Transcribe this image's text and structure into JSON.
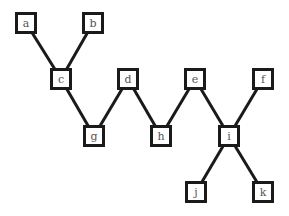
{
  "diagram": {
    "type": "graph",
    "stroke_color": "#1a1a1a",
    "label_color": "#555555",
    "nodes": [
      {
        "id": "a",
        "label": "a",
        "x": 15,
        "y": 12
      },
      {
        "id": "b",
        "label": "b",
        "x": 82,
        "y": 12
      },
      {
        "id": "c",
        "label": "c",
        "x": 50,
        "y": 68
      },
      {
        "id": "d",
        "label": "d",
        "x": 117,
        "y": 68
      },
      {
        "id": "e",
        "label": "e",
        "x": 184,
        "y": 68
      },
      {
        "id": "f",
        "label": "f",
        "x": 252,
        "y": 68
      },
      {
        "id": "g",
        "label": "g",
        "x": 83,
        "y": 125
      },
      {
        "id": "h",
        "label": "h",
        "x": 150,
        "y": 125
      },
      {
        "id": "i",
        "label": "i",
        "x": 218,
        "y": 125
      },
      {
        "id": "j",
        "label": "j",
        "x": 185,
        "y": 181
      },
      {
        "id": "k",
        "label": "k",
        "x": 252,
        "y": 181
      }
    ],
    "edges": [
      [
        "a",
        "c"
      ],
      [
        "b",
        "c"
      ],
      [
        "c",
        "g"
      ],
      [
        "d",
        "g"
      ],
      [
        "d",
        "h"
      ],
      [
        "e",
        "h"
      ],
      [
        "e",
        "i"
      ],
      [
        "f",
        "i"
      ],
      [
        "i",
        "j"
      ],
      [
        "i",
        "k"
      ]
    ]
  }
}
